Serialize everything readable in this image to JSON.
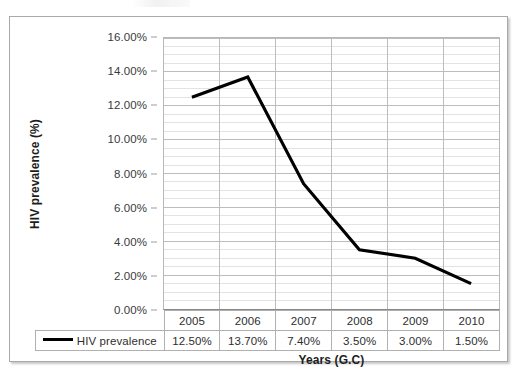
{
  "chart_data": {
    "type": "line",
    "title": "",
    "xlabel": "Years (G.C)",
    "ylabel": "HIV prevalence (%)",
    "categories": [
      "2005",
      "2006",
      "2007",
      "2008",
      "2009",
      "2010"
    ],
    "series": [
      {
        "name": "HIV prevalence",
        "values": [
          12.5,
          13.7,
          7.4,
          3.5,
          3.0,
          1.5
        ],
        "value_labels": [
          "12.50%",
          "13.70%",
          "7.40%",
          "3.50%",
          "3.00%",
          "1.50%"
        ],
        "color": "#000000"
      }
    ],
    "ylim": [
      0,
      16
    ],
    "ytick_values": [
      0,
      2,
      4,
      6,
      8,
      10,
      12,
      14,
      16
    ],
    "ytick_labels": [
      "0.00%",
      "2.00%",
      "4.00%",
      "6.00%",
      "8.00%",
      "10.00%",
      "12.00%",
      "14.00%",
      "16.00%"
    ],
    "y_minor_step": 0.5,
    "grid": {
      "horizontal_major": true,
      "horizontal_minor": true,
      "vertical_major": true
    },
    "legend": {
      "position": "data-table-row",
      "entries": [
        "HIV prevalence"
      ]
    },
    "has_data_table": true
  },
  "axes": {
    "y_title": "HIV prevalence (%)",
    "x_title": "Years (G.C)"
  },
  "legend": {
    "series_label": "HIV prevalence"
  },
  "colors": {
    "series_line": "#000000",
    "frame_border": "#a9a9a9",
    "plot_border": "#b7b7b7",
    "grid_major": "#bcbcbc",
    "grid_minor": "#e3e3e3",
    "table_border": "#b0b0b0",
    "text": "#2e2e2e"
  }
}
